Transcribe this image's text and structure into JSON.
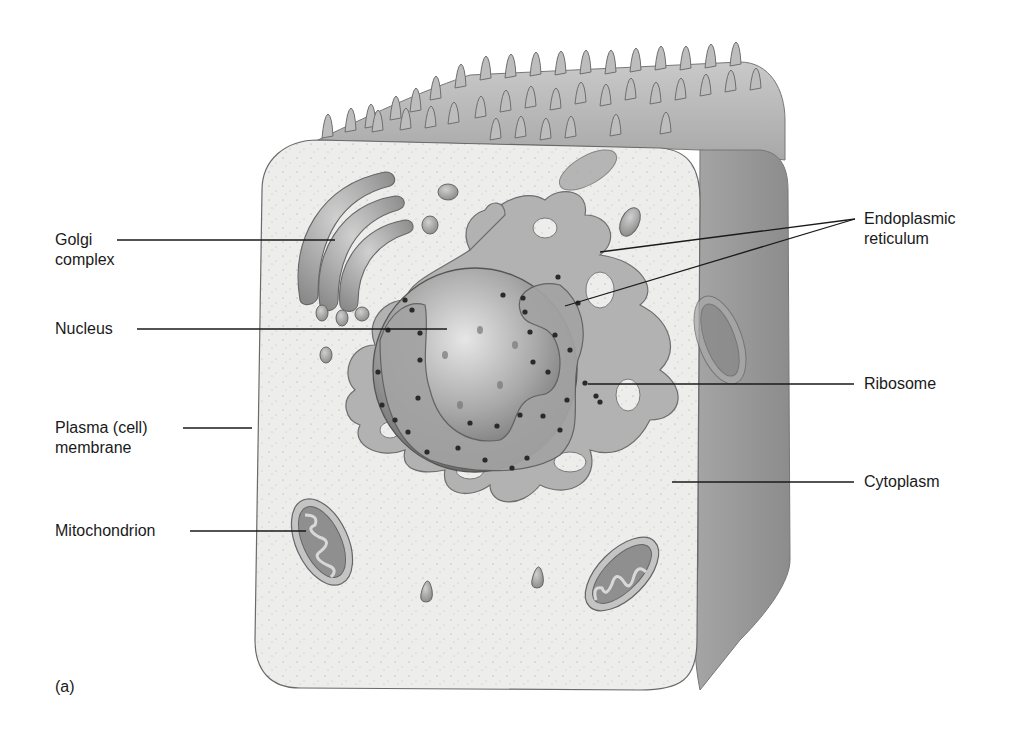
{
  "figure": {
    "panel_label": "(a)",
    "colors": {
      "background": "#ffffff",
      "cytoplasm": "#ececea",
      "cube_side": "#9a9a9a",
      "cube_top": "#b8b8b8",
      "organelle": "#a9a9a9",
      "organelle_dark": "#7a7a7a",
      "ribosome": "#2a2a2a",
      "leader_line": "#1a1a1a",
      "text": "#1a1a1a"
    }
  },
  "labels": {
    "left": [
      {
        "id": "golgi",
        "text": "Golgi\ncomplex"
      },
      {
        "id": "nucleus",
        "text": "Nucleus"
      },
      {
        "id": "plasma",
        "text": "Plasma (cell)\nmembrane"
      },
      {
        "id": "mito",
        "text": "Mitochondrion"
      }
    ],
    "right": [
      {
        "id": "er",
        "text": "Endoplasmic\nreticulum"
      },
      {
        "id": "ribosome",
        "text": "Ribosome"
      },
      {
        "id": "cytoplasm",
        "text": "Cytoplasm"
      }
    ]
  }
}
